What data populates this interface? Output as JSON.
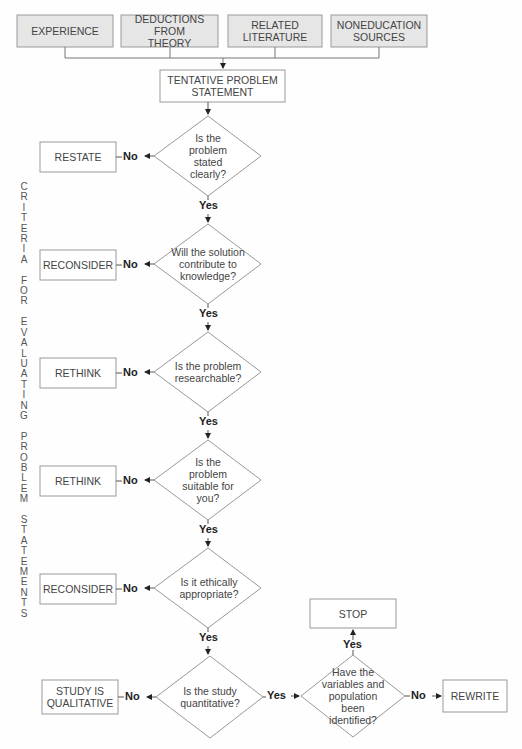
{
  "sources": [
    {
      "label": "EXPERIENCE"
    },
    {
      "label": "DEDUCTIONS FROM THEORY"
    },
    {
      "label": "RELATED LITERATURE"
    },
    {
      "label": "NONEDUCATION SOURCES"
    }
  ],
  "tentative": {
    "label": "TENTATIVE PROBLEM STATEMENT"
  },
  "criteria": [
    {
      "question": "Is the problem stated clearly?",
      "no_action": "RESTATE"
    },
    {
      "question": "Will the solution contribute to knowledge?",
      "no_action": "RECONSIDER"
    },
    {
      "question": "Is the problem researchable?",
      "no_action": "RETHINK"
    },
    {
      "question": "Is the problem suitable for you?",
      "no_action": "RETHINK"
    },
    {
      "question": "Is it ethically appropriate?",
      "no_action": "RECONSIDER"
    },
    {
      "question": "Is the study quantitative?",
      "no_action": "STUDY IS QUALITATIVE"
    }
  ],
  "final": {
    "question": "Have the variables and population been identified?",
    "yes_action": "STOP",
    "no_action": "REWRITE"
  },
  "labels": {
    "yes": "Yes",
    "no": "No"
  },
  "side_title": "CRITERIA FOR EVALUATING PROBLEM STATEMENTS",
  "colors": {
    "source_fill": "#e6e6e6",
    "stroke": "#888888",
    "text": "#444444"
  }
}
